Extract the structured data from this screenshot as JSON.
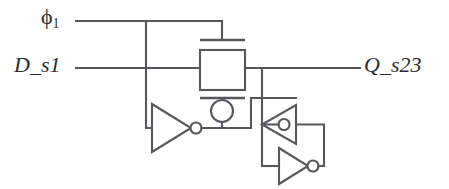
{
  "figure": {
    "type": "circuit-schematic",
    "background_color": "#ffffff",
    "line_color": "#58585c",
    "text_color": "#2b2b2e"
  },
  "labels": {
    "clock": {
      "symbol": "ϕ",
      "subscript": "1",
      "full": "ϕ1"
    },
    "input": {
      "text": "D_s1"
    },
    "output": {
      "text": "Q_s23"
    }
  },
  "nets": [
    {
      "name": "clock-phi1",
      "label": "ϕ1"
    },
    {
      "name": "data-in",
      "label": "D_s1"
    },
    {
      "name": "data-out",
      "label": "Q_s23"
    }
  ],
  "components": [
    {
      "name": "pass-transistor",
      "kind": "switch-box"
    },
    {
      "name": "clock-inverter",
      "kind": "inverter",
      "orientation": "right"
    },
    {
      "name": "latch-inverter-upper",
      "kind": "inverter",
      "orientation": "left"
    },
    {
      "name": "latch-inverter-lower",
      "kind": "inverter",
      "orientation": "right"
    }
  ]
}
